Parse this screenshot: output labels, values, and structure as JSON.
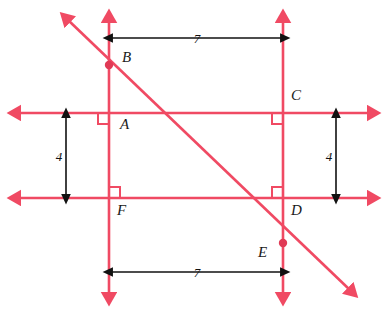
{
  "figure": {
    "colors": {
      "line": "#f04a63",
      "line_dark": "#e03a55",
      "label": "#1a1a1a",
      "dimension": "#111111",
      "background": "#ffffff"
    },
    "points": [
      {
        "id": "A",
        "label": "A",
        "x": 109,
        "y": 113,
        "label_x": 120,
        "label_y": 129,
        "marked": false
      },
      {
        "id": "B",
        "label": "B",
        "x": 109,
        "y": 65,
        "label_x": 122,
        "label_y": 62,
        "marked": true
      },
      {
        "id": "C",
        "label": "C",
        "x": 283,
        "y": 113,
        "label_x": 291,
        "label_y": 100,
        "marked": false
      },
      {
        "id": "D",
        "label": "D",
        "x": 283,
        "y": 198,
        "label_x": 291,
        "label_y": 215,
        "marked": false
      },
      {
        "id": "E",
        "label": "E",
        "x": 283,
        "y": 243,
        "label_x": 258,
        "label_y": 257,
        "marked": true
      },
      {
        "id": "F",
        "label": "F",
        "x": 109,
        "y": 198,
        "label_x": 117,
        "label_y": 215,
        "marked": false
      }
    ],
    "lines": [
      {
        "id": "upper-horizontal",
        "name": "line-through-A-C",
        "x1": 18,
        "y1": 113,
        "x2": 370,
        "y2": 113,
        "arrow_start": true,
        "arrow_end": true
      },
      {
        "id": "lower-horizontal",
        "name": "line-through-F-D",
        "x1": 18,
        "y1": 198,
        "x2": 370,
        "y2": 198,
        "arrow_start": true,
        "arrow_end": true
      },
      {
        "id": "left-vertical",
        "name": "line-through-B-A-F",
        "x1": 109,
        "y1": 20,
        "x2": 109,
        "y2": 295,
        "arrow_start": true,
        "arrow_end": true
      },
      {
        "id": "right-vertical",
        "name": "line-through-C-D-E",
        "x1": 283,
        "y1": 20,
        "x2": 283,
        "y2": 295,
        "arrow_start": true,
        "arrow_end": true
      },
      {
        "id": "transversal",
        "name": "transversal-through-B-E",
        "x1": 68,
        "y1": 20,
        "x2": 350,
        "y2": 290,
        "arrow_start": true,
        "arrow_end": true
      }
    ],
    "right_angles": [
      {
        "at": "A",
        "x": 109,
        "y": 113,
        "dx": -1,
        "dy": 1,
        "size": 11
      },
      {
        "at": "C",
        "x": 283,
        "y": 113,
        "dx": -1,
        "dy": 1,
        "size": 11
      },
      {
        "at": "F",
        "x": 109,
        "y": 198,
        "dx": 1,
        "dy": -1,
        "size": 11
      },
      {
        "at": "D",
        "x": 283,
        "y": 198,
        "dx": -1,
        "dy": -1,
        "size": 11
      }
    ],
    "dimensions": [
      {
        "id": "top-width",
        "value": "7",
        "orientation": "horizontal",
        "x1": 112,
        "x2": 281,
        "y": 38,
        "label_x": 197,
        "label_y": 43
      },
      {
        "id": "bottom-width",
        "value": "7",
        "orientation": "horizontal",
        "x1": 112,
        "x2": 281,
        "y": 272,
        "label_x": 197,
        "label_y": 277
      },
      {
        "id": "left-height",
        "value": "4",
        "orientation": "vertical",
        "y1": 117,
        "y2": 195,
        "x": 66,
        "label_x": 59,
        "label_y": 161
      },
      {
        "id": "right-height",
        "value": "4",
        "orientation": "vertical",
        "y1": 117,
        "y2": 195,
        "x": 336,
        "label_x": 329,
        "label_y": 161
      }
    ]
  }
}
